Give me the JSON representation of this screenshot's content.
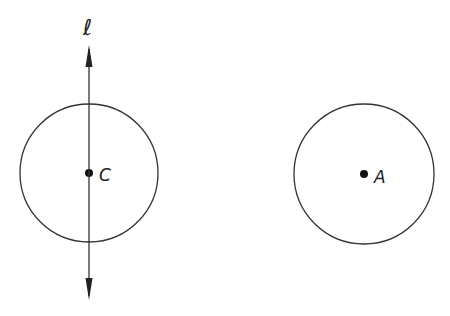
{
  "diagram": {
    "background": "#ffffff",
    "stroke_color": "#333333",
    "line": {
      "label": "ℓ",
      "x": 89,
      "y_top": 45,
      "y_bottom": 300,
      "arrows": "both"
    },
    "circles": [
      {
        "name": "circle-c",
        "center_label": "C",
        "cx": 89,
        "cy": 173,
        "r": 69
      },
      {
        "name": "circle-a",
        "center_label": "A",
        "cx": 364,
        "cy": 174,
        "r": 70
      }
    ]
  }
}
